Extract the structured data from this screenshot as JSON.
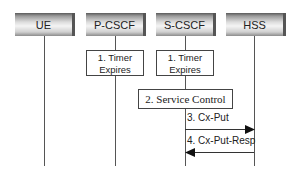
{
  "diagram": {
    "type": "sequence",
    "participants": [
      {
        "id": "ue",
        "label": "UE"
      },
      {
        "id": "pcscf",
        "label": "P-CSCF"
      },
      {
        "id": "scscf",
        "label": "S-CSCF"
      },
      {
        "id": "hss",
        "label": "HSS"
      }
    ],
    "steps": [
      {
        "label": "1. Timer",
        "label2": "Expires",
        "at": "pcscf",
        "kind": "box"
      },
      {
        "label": "1. Timer",
        "label2": "Expires",
        "at": "scscf",
        "kind": "box"
      },
      {
        "label": "2. Service Control",
        "at": "scscf",
        "kind": "box"
      },
      {
        "label": "3. Cx-Put",
        "from": "scscf",
        "to": "hss",
        "kind": "message"
      },
      {
        "label": "4. Cx-Put-Resp",
        "from": "hss",
        "to": "scscf",
        "kind": "message"
      }
    ]
  }
}
